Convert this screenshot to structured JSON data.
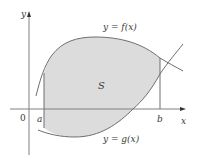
{
  "figure": {
    "type": "region-between-curves",
    "axes": {
      "x_label": "x",
      "y_label": "y",
      "origin_label": "0"
    },
    "bounds": {
      "a_label": "a",
      "b_label": "b"
    },
    "curves": {
      "upper_label": "y = f(x)",
      "lower_label": "y = g(x)"
    },
    "region_label": "S",
    "colors": {
      "region_fill": "#dcdcdc",
      "curve_stroke": "#6e6e6e",
      "axis_stroke": "#808080",
      "text": "#3a3a3a",
      "background": "#ffffff"
    }
  }
}
